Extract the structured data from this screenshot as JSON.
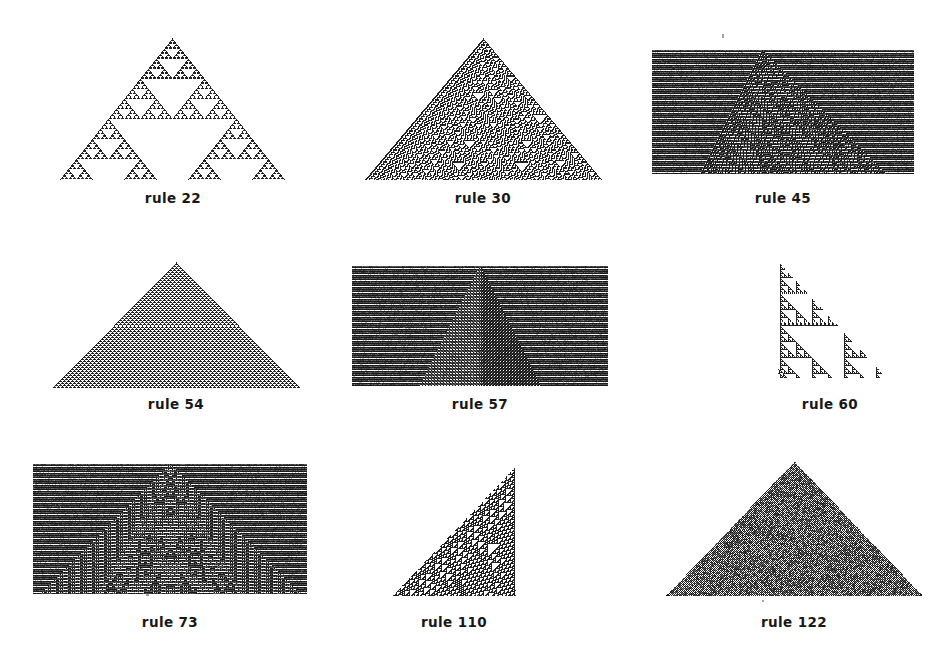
{
  "figure": {
    "width": 951,
    "height": 664,
    "background": "#ffffff",
    "ink": "#181818",
    "label_prefix": "rule"
  },
  "panels": [
    {
      "id": "rule-22",
      "rule": 22,
      "label": "rule 22",
      "class": "fractal",
      "shape": "triangle-centered",
      "frame": {
        "x": 48,
        "y": 32,
        "w": 250,
        "h": 152
      },
      "plot": {
        "x": 58,
        "y": 38,
        "w": 228,
        "h": 142
      },
      "label_y": 190,
      "cols": 229,
      "rows": 113,
      "cell": 1,
      "seed": "single-center",
      "background_filled": false,
      "density": 0.22,
      "ink": "#141414"
    },
    {
      "id": "rule-30",
      "rule": 30,
      "label": "rule 30",
      "class": "chaotic",
      "shape": "triangle-centered",
      "frame": {
        "x": 355,
        "y": 32,
        "w": 256,
        "h": 152
      },
      "plot": {
        "x": 363,
        "y": 38,
        "w": 240,
        "h": 142
      },
      "label_y": 190,
      "cols": 241,
      "rows": 119,
      "cell": 1,
      "seed": "single-center",
      "background_filled": false,
      "density": 0.5,
      "ink": "#141414"
    },
    {
      "id": "rule-45",
      "rule": 45,
      "label": "rule 45",
      "class": "chaotic",
      "shape": "rectangle-striped",
      "frame": {
        "x": 650,
        "y": 44,
        "w": 266,
        "h": 132
      },
      "plot": {
        "x": 652,
        "y": 50,
        "w": 262,
        "h": 124
      },
      "label_y": 190,
      "cols": 263,
      "rows": 124,
      "cell": 1,
      "seed": "single-left-of-center",
      "background_filled": true,
      "density": 0.5,
      "ink": "#141414"
    },
    {
      "id": "rule-54",
      "rule": 54,
      "label": "rule 54",
      "class": "periodic",
      "shape": "triangle-centered",
      "frame": {
        "x": 42,
        "y": 256,
        "w": 268,
        "h": 134
      },
      "plot": {
        "x": 52,
        "y": 262,
        "w": 248,
        "h": 126
      },
      "label_y": 396,
      "cols": 249,
      "rows": 124,
      "cell": 1,
      "seed": "single-center",
      "background_filled": false,
      "density": 0.62,
      "ink": "#141414"
    },
    {
      "id": "rule-57",
      "rule": 57,
      "label": "rule 57",
      "class": "periodic",
      "shape": "rectangle-striped",
      "frame": {
        "x": 350,
        "y": 262,
        "w": 260,
        "h": 126
      },
      "plot": {
        "x": 352,
        "y": 266,
        "w": 256,
        "h": 120
      },
      "label_y": 396,
      "cols": 257,
      "rows": 120,
      "cell": 1,
      "seed": "single-center",
      "background_filled": true,
      "density": 0.5,
      "ink": "#141414"
    },
    {
      "id": "rule-60",
      "rule": 60,
      "label": "rule 60",
      "class": "fractal",
      "shape": "triangle-right",
      "frame": {
        "x": 772,
        "y": 258,
        "w": 116,
        "h": 124
      },
      "plot": {
        "x": 778,
        "y": 262,
        "w": 108,
        "h": 116
      },
      "label_y": 396,
      "cols": 109,
      "rows": 116,
      "cell": 1,
      "seed": "single-left",
      "background_filled": false,
      "density": 0.33,
      "ink": "#141414"
    },
    {
      "id": "rule-73",
      "rule": 73,
      "label": "rule 73",
      "class": "chaotic",
      "shape": "rectangle-striped",
      "frame": {
        "x": 30,
        "y": 460,
        "w": 280,
        "h": 136
      },
      "plot": {
        "x": 33,
        "y": 464,
        "w": 274,
        "h": 130
      },
      "label_y": 614,
      "cols": 275,
      "rows": 130,
      "cell": 1,
      "seed": "single-center",
      "background_filled": true,
      "density": 0.45,
      "ink": "#141414"
    },
    {
      "id": "rule-110",
      "rule": 110,
      "label": "rule 110",
      "class": "complex",
      "shape": "triangle-left",
      "frame": {
        "x": 388,
        "y": 462,
        "w": 132,
        "h": 136
      },
      "plot": {
        "x": 392,
        "y": 466,
        "w": 124,
        "h": 130
      },
      "label_y": 614,
      "cols": 125,
      "rows": 130,
      "cell": 1,
      "seed": "single-right",
      "background_filled": false,
      "density": 0.56,
      "ink": "#141414"
    },
    {
      "id": "rule-122",
      "rule": 122,
      "label": "rule 122",
      "class": "chaotic",
      "shape": "triangle-centered",
      "frame": {
        "x": 660,
        "y": 458,
        "w": 268,
        "h": 142
      },
      "plot": {
        "x": 666,
        "y": 462,
        "w": 256,
        "h": 134
      },
      "label_y": 614,
      "cols": 257,
      "rows": 132,
      "cell": 1,
      "seed": "single-center",
      "background_filled": false,
      "density": 0.93,
      "ink": "#0e0e0e"
    }
  ],
  "speckles": [
    {
      "x": 722,
      "y": 34,
      "w": 2,
      "h": 4
    },
    {
      "x": 146,
      "y": 594,
      "w": 3,
      "h": 2
    },
    {
      "x": 762,
      "y": 600,
      "w": 2,
      "h": 2
    }
  ]
}
